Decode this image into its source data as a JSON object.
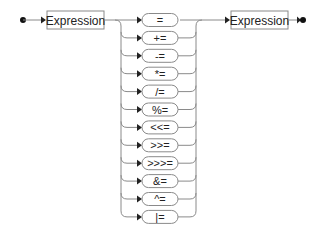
{
  "diagram": {
    "type": "railroad",
    "nonterminals": [
      {
        "id": "lhs",
        "label": "Expression"
      },
      {
        "id": "rhs",
        "label": "Expression"
      }
    ],
    "operators": [
      "=",
      "+=",
      "-=",
      "*=",
      "/=",
      "%=",
      "<<=",
      ">>=",
      ">>>=",
      "&=",
      "^=",
      "|="
    ],
    "colors": {
      "line": "#8a8a8a",
      "text": "#222222",
      "marker": "#111111"
    }
  }
}
